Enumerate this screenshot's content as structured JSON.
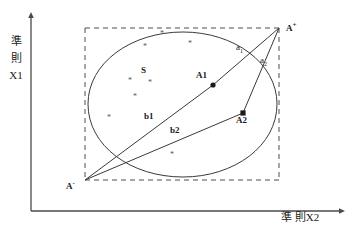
{
  "figure": {
    "axes": {
      "y_label_lines": [
        "準",
        "則",
        "X1"
      ],
      "x_label": "準 則X2"
    },
    "points": [
      {
        "id": "a-plus",
        "label": "A",
        "superscript": "+",
        "x": 279,
        "y": 28,
        "label_x": 286,
        "label_y": 24,
        "marker": "none"
      },
      {
        "id": "a-minus",
        "label": "A",
        "superscript": "-",
        "x": 85,
        "y": 180,
        "label_x": 68,
        "label_y": 182,
        "marker": "none"
      },
      {
        "id": "a1",
        "label": "A1",
        "superscript": "",
        "x": 213,
        "y": 85,
        "label_x": 198,
        "label_y": 75,
        "marker": "dot"
      },
      {
        "id": "a2",
        "label": "A2",
        "superscript": "",
        "x": 243,
        "y": 113,
        "label_x": 238,
        "label_y": 118,
        "marker": "square"
      }
    ],
    "segment_labels": [
      {
        "id": "a1-seg",
        "text": "a",
        "subscript": "1",
        "x": 238,
        "y": 48
      },
      {
        "id": "a2-seg",
        "text": "a",
        "subscript": "2",
        "x": 262,
        "y": 61
      },
      {
        "id": "b1-seg",
        "text": "b1",
        "subscript": "",
        "x": 146,
        "y": 117
      },
      {
        "id": "b2-seg",
        "text": "b2",
        "subscript": "",
        "x": 172,
        "y": 131
      }
    ],
    "region_label": {
      "text": "S",
      "x": 143,
      "y": 71
    },
    "scatter_points": [
      {
        "x": 160,
        "y": 33
      },
      {
        "x": 188,
        "y": 43
      },
      {
        "x": 143,
        "y": 46
      },
      {
        "x": 128,
        "y": 80
      },
      {
        "x": 148,
        "y": 82
      },
      {
        "x": 133,
        "y": 96
      },
      {
        "x": 107,
        "y": 117
      },
      {
        "x": 170,
        "y": 154
      }
    ],
    "colors": {
      "axis": "#4a4a4a",
      "line": "#3a3a3a",
      "dashed": "#3a3a3a",
      "blob": "#3a3a3a",
      "text": "#1a1a1a"
    }
  }
}
